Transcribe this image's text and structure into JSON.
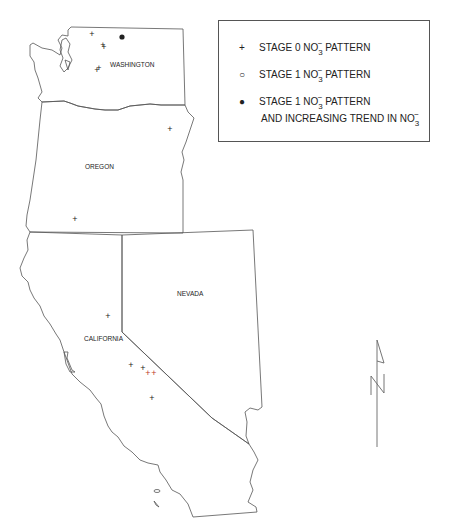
{
  "states": [
    {
      "name": "WASHINGTON",
      "label": "WASHINGTON"
    },
    {
      "name": "OREGON",
      "label": "OREGON"
    },
    {
      "name": "CALIFORNIA",
      "label": "CALIFORNIA"
    },
    {
      "name": "NEVADA",
      "label": "NEVADA"
    }
  ],
  "legend": {
    "items": [
      {
        "symbol": "+",
        "symbol_name": "plus",
        "text": "STAGE 0 NO",
        "chem_sub": "3",
        "chem_sup": "−",
        "text_after": " PATTERN",
        "line2": ""
      },
      {
        "symbol": "○",
        "symbol_name": "open-circle",
        "text": "STAGE 1 NO",
        "chem_sub": "3",
        "chem_sup": "−",
        "text_after": " PATTERN",
        "line2": ""
      },
      {
        "symbol": "●",
        "symbol_name": "filled-circle",
        "text": "STAGE 1 NO",
        "chem_sub": "3",
        "chem_sup": "−",
        "text_after": " PATTERN",
        "line2": "AND INCREASING TREND IN NO",
        "line2_sub": "3",
        "line2_sup": "−"
      }
    ]
  },
  "sites": [
    {
      "state": "WASHINGTON",
      "type": "stage0",
      "x": 92,
      "y": 34
    },
    {
      "state": "WASHINGTON",
      "type": "stage0",
      "x": 103,
      "y": 45
    },
    {
      "state": "WASHINGTON",
      "type": "stage0",
      "x": 104,
      "y": 47
    },
    {
      "state": "WASHINGTON",
      "type": "stage1-trend",
      "x": 122,
      "y": 38
    },
    {
      "state": "WASHINGTON",
      "type": "stage0",
      "x": 97,
      "y": 70
    },
    {
      "state": "WASHINGTON",
      "type": "stage0",
      "x": 99,
      "y": 68
    },
    {
      "state": "OREGON",
      "type": "stage0",
      "x": 170,
      "y": 129
    },
    {
      "state": "OREGON",
      "type": "stage0",
      "x": 75,
      "y": 219
    },
    {
      "state": "CALIFORNIA",
      "type": "stage0",
      "x": 108,
      "y": 316
    },
    {
      "state": "CALIFORNIA",
      "type": "stage0",
      "x": 131,
      "y": 365
    },
    {
      "state": "CALIFORNIA",
      "type": "stage0",
      "x": 143,
      "y": 368
    },
    {
      "state": "CALIFORNIA",
      "type": "stage0-red",
      "x": 148,
      "y": 373
    },
    {
      "state": "CALIFORNIA",
      "type": "stage0-red",
      "x": 154,
      "y": 373
    },
    {
      "state": "CALIFORNIA",
      "type": "stage0",
      "x": 152,
      "y": 398
    }
  ],
  "colors": {
    "outline": "#555555",
    "marker": "#222222",
    "marker_red": "#c0392b"
  },
  "north_arrow": {
    "label": "N"
  }
}
